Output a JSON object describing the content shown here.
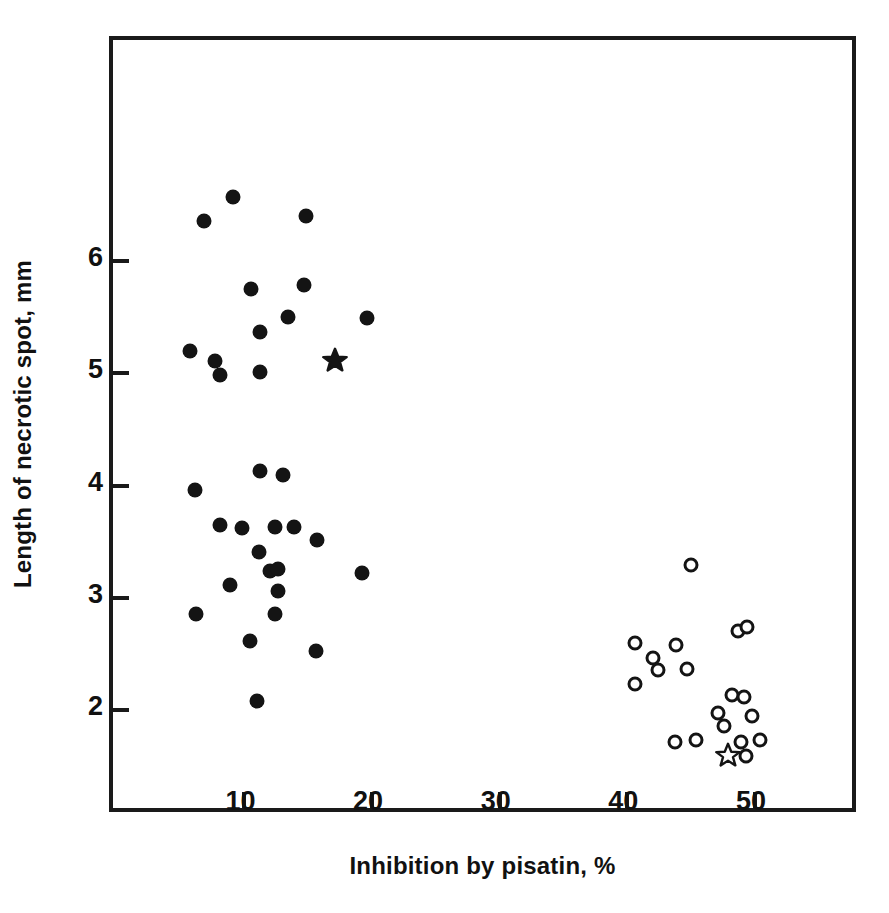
{
  "chart_data": {
    "type": "scatter",
    "title": "",
    "xlabel": "Inhibition by pisatin, %",
    "ylabel": "Length of necrotic spot, mm",
    "xlim": [
      -0.3,
      57.6
    ],
    "ylim": [
      1.13,
      7.97
    ],
    "xticks": [
      10,
      20,
      30,
      40,
      50
    ],
    "yticks": [
      2,
      3,
      4,
      5,
      6
    ],
    "xtick_labels": [
      "10",
      "20",
      "30",
      "40",
      "50"
    ],
    "ytick_labels": [
      "2",
      "3",
      "4",
      "5",
      "6"
    ],
    "grid": false,
    "legend": "none",
    "series": [
      {
        "name": "filled-circles",
        "marker": "filled-circle",
        "color": "#141414",
        "points": [
          [
            9.1,
            6.57
          ],
          [
            6.8,
            6.36
          ],
          [
            14.8,
            6.4
          ],
          [
            14.7,
            5.79
          ],
          [
            10.5,
            5.75
          ],
          [
            13.4,
            5.5
          ],
          [
            19.6,
            5.49
          ],
          [
            11.2,
            5.37
          ],
          [
            5.7,
            5.2
          ],
          [
            7.7,
            5.11
          ],
          [
            8.1,
            4.99
          ],
          [
            11.2,
            5.01
          ],
          [
            11.2,
            4.13
          ],
          [
            13.0,
            4.1
          ],
          [
            6.1,
            3.96
          ],
          [
            8.1,
            3.65
          ],
          [
            9.8,
            3.62
          ],
          [
            12.4,
            3.63
          ],
          [
            13.9,
            3.63
          ],
          [
            15.7,
            3.52
          ],
          [
            11.1,
            3.41
          ],
          [
            12.0,
            3.24
          ],
          [
            12.6,
            3.26
          ],
          [
            19.2,
            3.22
          ],
          [
            8.9,
            3.12
          ],
          [
            12.6,
            3.06
          ],
          [
            6.2,
            2.86
          ],
          [
            12.4,
            2.86
          ],
          [
            10.4,
            2.62
          ],
          [
            15.6,
            2.53
          ],
          [
            11.0,
            2.08
          ]
        ]
      },
      {
        "name": "open-circles",
        "marker": "open-circle",
        "color": "#141414",
        "points": [
          [
            45.0,
            3.29
          ],
          [
            48.7,
            2.71
          ],
          [
            49.4,
            2.74
          ],
          [
            40.6,
            2.6
          ],
          [
            43.8,
            2.58
          ],
          [
            42.0,
            2.47
          ],
          [
            42.4,
            2.36
          ],
          [
            44.7,
            2.37
          ],
          [
            40.6,
            2.23
          ],
          [
            48.2,
            2.14
          ],
          [
            49.1,
            2.12
          ],
          [
            47.1,
            1.98
          ],
          [
            47.6,
            1.86
          ],
          [
            49.8,
            1.95
          ],
          [
            43.7,
            1.72
          ],
          [
            45.4,
            1.74
          ],
          [
            48.9,
            1.72
          ],
          [
            50.4,
            1.74
          ],
          [
            49.3,
            1.59
          ]
        ]
      },
      {
        "name": "filled-star",
        "marker": "filled-star",
        "color": "#141414",
        "points": [
          [
            17.1,
            5.12
          ]
        ]
      },
      {
        "name": "open-star",
        "marker": "open-star",
        "color": "#141414",
        "points": [
          [
            47.9,
            1.6
          ]
        ]
      }
    ]
  }
}
